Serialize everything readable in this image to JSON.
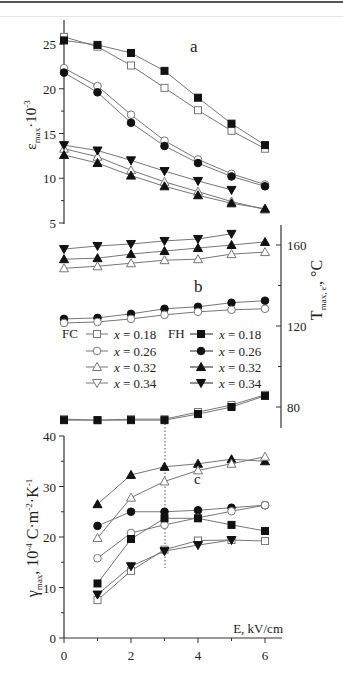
{
  "chart_data": [
    {
      "panel": "a",
      "type": "line",
      "title": "a",
      "xlabel": "",
      "ylabel": "ε_max·10^-3",
      "ylim": [
        4,
        27
      ],
      "yticks": [
        5,
        10,
        15,
        20,
        25
      ],
      "x": [
        0,
        1,
        2,
        3,
        4,
        5,
        6
      ],
      "series": [
        {
          "name": "FC x = 0.18",
          "marker": "square-open",
          "values": [
            25.8,
            24.7,
            22.6,
            20.1,
            17.6,
            15.3,
            13.3
          ]
        },
        {
          "name": "FH x = 0.18",
          "marker": "square-filled",
          "values": [
            25.4,
            24.9,
            24.0,
            22.0,
            19.0,
            16.1,
            13.7
          ]
        },
        {
          "name": "FC x = 0.26",
          "marker": "circle-open",
          "values": [
            22.3,
            20.3,
            17.1,
            14.2,
            12.1,
            10.5,
            9.3
          ]
        },
        {
          "name": "FH x = 0.26",
          "marker": "circle-filled",
          "values": [
            21.8,
            19.6,
            16.2,
            13.6,
            11.7,
            10.2,
            9.1
          ]
        },
        {
          "name": "FC x = 0.32",
          "marker": "triangle-up-open",
          "values": [
            13.3,
            12.4,
            10.9,
            9.6,
            8.5,
            7.4,
            6.5
          ]
        },
        {
          "name": "FH x = 0.32",
          "marker": "triangle-up-filled",
          "values": [
            12.6,
            11.7,
            10.3,
            9.1,
            8.1,
            7.2,
            6.6
          ]
        },
        {
          "name": "FH x = 0.34",
          "marker": "triangle-down-filled",
          "values": [
            13.7,
            13.1,
            12.0,
            10.8,
            9.7,
            8.7,
            null
          ]
        }
      ]
    },
    {
      "panel": "b",
      "type": "line",
      "title": "b",
      "xlabel": "",
      "ylabel": "T_max,ε', °C",
      "ylabel_side": "right",
      "ylim": [
        70,
        170
      ],
      "yticks": [
        80,
        120,
        160
      ],
      "x": [
        0,
        1,
        2,
        3,
        4,
        5,
        6
      ],
      "series": [
        {
          "name": "FH x = 0.34",
          "marker": "triangle-down-filled",
          "values": [
            158,
            159.5,
            160.5,
            162,
            163,
            165.5,
            null
          ]
        },
        {
          "name": "FH x = 0.32",
          "marker": "triangle-up-filled",
          "values": [
            153,
            153.5,
            155.5,
            157,
            158.5,
            160,
            161.5
          ]
        },
        {
          "name": "FC x = 0.32",
          "marker": "triangle-up-open",
          "values": [
            148.5,
            149.5,
            151,
            152.5,
            153,
            155.5,
            156.5
          ]
        },
        {
          "name": "FH x = 0.26",
          "marker": "circle-filled",
          "values": [
            123.5,
            124,
            126,
            128.5,
            129.5,
            131.5,
            132.5
          ]
        },
        {
          "name": "FC x = 0.26",
          "marker": "circle-open",
          "values": [
            121.5,
            122,
            123.5,
            125.5,
            127,
            128,
            128.5
          ]
        },
        {
          "name": "FC x = 0.18",
          "marker": "square-open",
          "values": [
            74,
            73.5,
            74,
            74,
            77.5,
            81,
            86
          ]
        },
        {
          "name": "FH x = 0.18",
          "marker": "square-filled",
          "values": [
            73.5,
            73.5,
            73.5,
            73.5,
            76.5,
            80,
            85.5
          ]
        }
      ]
    },
    {
      "panel": "c",
      "type": "line",
      "title": "c",
      "xlabel": "E, kV/cm",
      "ylabel": "γ_max, 10^-4 C·m^-2·K^-1",
      "xlim": [
        0,
        6.4
      ],
      "ylim": [
        0,
        40
      ],
      "xticks": [
        0,
        2,
        4,
        6
      ],
      "yticks": [
        0,
        10,
        20,
        30,
        40
      ],
      "x": [
        1,
        2,
        3,
        4,
        5,
        6
      ],
      "annotation": "dotted vertical line at E = 3 kV/cm across panels b and c",
      "series": [
        {
          "name": "FH x = 0.32",
          "marker": "triangle-up-filled",
          "values": [
            26.5,
            32.3,
            33.9,
            34.5,
            35.4,
            35.0
          ]
        },
        {
          "name": "FC x = 0.32",
          "marker": "triangle-up-open",
          "values": [
            19.8,
            27.8,
            31.0,
            33.2,
            34.5,
            35.9
          ]
        },
        {
          "name": "FH x = 0.26",
          "marker": "circle-filled",
          "values": [
            22.2,
            25.0,
            25.0,
            25.3,
            25.8,
            26.3
          ]
        },
        {
          "name": "FC x = 0.26",
          "marker": "circle-open",
          "values": [
            15.8,
            20.8,
            22.4,
            23.8,
            25.1,
            26.3
          ]
        },
        {
          "name": "FH x = 0.18",
          "marker": "square-filled",
          "values": [
            10.8,
            19.6,
            23.7,
            23.7,
            22.4,
            21.2
          ]
        },
        {
          "name": "FC x = 0.18",
          "marker": "square-open",
          "values": [
            7.5,
            13.3,
            17.5,
            19.3,
            19.4,
            19.2
          ]
        },
        {
          "name": "FH x = 0.34",
          "marker": "triangle-down-filled",
          "values": [
            8.6,
            14.2,
            17.2,
            18.4,
            19.4,
            null
          ]
        }
      ]
    }
  ],
  "labels": {
    "panel_a": "a",
    "panel_b": "b",
    "panel_c": "c",
    "ylabel_a_main": "ε",
    "ylabel_a_sub": "max",
    "ylabel_a_rest": "·10",
    "ylabel_a_sup": "-3",
    "ylabel_b_main": "T",
    "ylabel_b_sub": "max, ε'",
    "ylabel_b_rest": ", °C",
    "ylabel_c_main": "γ",
    "ylabel_c_sub": "max",
    "ylabel_c_rest1": ", 10",
    "ylabel_c_sup1": "-4",
    "ylabel_c_rest2": " C·m",
    "ylabel_c_sup2": "-2",
    "ylabel_c_rest3": "·K",
    "ylabel_c_sup3": "-1",
    "xlabel_c": "E, kV/cm"
  },
  "legend": {
    "group_fc": "FC",
    "group_fh": "FH",
    "rows": [
      {
        "fc_marker": "square-open",
        "fh_marker": "square-filled",
        "fc_label": "x = 0.18",
        "fh_label": "x = 0.18",
        "x_var": "x",
        "value": "= 0.18"
      },
      {
        "fc_marker": "circle-open",
        "fh_marker": "circle-filled",
        "fc_label": "x = 0.26",
        "fh_label": "x = 0.26",
        "x_var": "x",
        "value": "= 0.26"
      },
      {
        "fc_marker": "triangle-up-open",
        "fh_marker": "triangle-up-filled",
        "fc_label": "x = 0.32",
        "fh_label": "x = 0.32",
        "x_var": "x",
        "value": "= 0.32"
      },
      {
        "fc_marker": "triangle-down-open",
        "fh_marker": "triangle-down-filled",
        "fc_label": "x = 0.34",
        "fh_label": "x = 0.34",
        "x_var": "x",
        "value": "= 0.34"
      }
    ]
  },
  "axes": {
    "a_yticks": [
      "5",
      "10",
      "15",
      "20",
      "25"
    ],
    "b_yticks": [
      "80",
      "120",
      "160"
    ],
    "c_yticks": [
      "0",
      "10",
      "20",
      "30",
      "40"
    ],
    "c_xticks": [
      "0",
      "2",
      "4",
      "6"
    ]
  },
  "colors": {
    "line": "#777777",
    "axis": "#333333",
    "marker_fill": "#111111",
    "open_marker_stroke": "#777777",
    "text": "#222222"
  }
}
